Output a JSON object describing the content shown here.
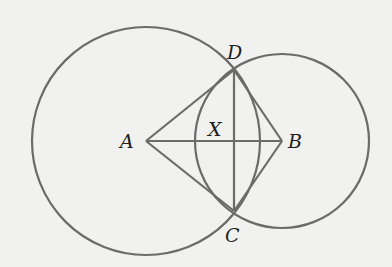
{
  "diagram": {
    "background": "#f1f1f0",
    "stroke_color": "#6b6b6b",
    "label_color": "#1e1e1e",
    "points": {
      "A": {
        "label": "A",
        "x": 146,
        "y": 141
      },
      "B": {
        "label": "B",
        "x": 282,
        "y": 141
      },
      "C": {
        "label": "C",
        "x": 234,
        "y": 211
      },
      "D": {
        "label": "D",
        "x": 234,
        "y": 70
      },
      "X": {
        "label": "X",
        "x": 234,
        "y": 141
      }
    },
    "circles": [
      {
        "name": "circle-A",
        "center": "A",
        "r": 114
      },
      {
        "name": "circle-B",
        "center": "B",
        "r": 87
      }
    ],
    "segments": [
      "AB",
      "AD",
      "AC",
      "BD",
      "BC",
      "DC"
    ],
    "labels": {
      "A": "A",
      "B": "B",
      "C": "C",
      "D": "D",
      "X": "X"
    }
  }
}
